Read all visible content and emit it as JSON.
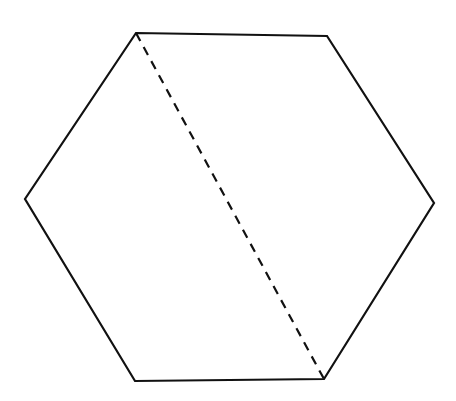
{
  "diagram": {
    "type": "hexagon-with-diagonal",
    "background": "#ffffff",
    "stroke_color": "#111111",
    "hexagon": {
      "points": [
        [
          136,
          33
        ],
        [
          327,
          36
        ],
        [
          434,
          203
        ],
        [
          324,
          379
        ],
        [
          135,
          381
        ],
        [
          25,
          199
        ]
      ]
    },
    "diagonal": {
      "style": "dashed",
      "from": [
        136,
        33
      ],
      "to": [
        324,
        379
      ]
    }
  }
}
